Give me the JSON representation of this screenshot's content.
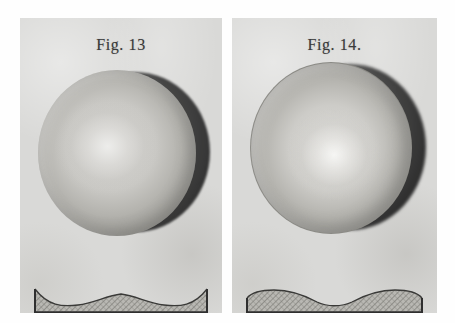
{
  "plate": {
    "background_color": "#ffffff",
    "paper_color": "#d9d9d7",
    "ink_color": "#3a3a3a"
  },
  "figures": [
    {
      "id": "fig-13",
      "label": "Fig. 13",
      "subject": "shaded-sphere-with-offset-crescent-shadow",
      "sphere": {
        "highlight_position": "center-left",
        "shadow_crescent_side": "right",
        "crescent_width": "narrow",
        "outline": "soft"
      },
      "profile": {
        "name": "convex-central-hump-profile",
        "shape": "central raised hump with concave dips at both ends",
        "hatching": "fine diagonal cross-hatch",
        "border_color": "#2f2f2f",
        "fill_color": "#b9b8b3"
      }
    },
    {
      "id": "fig-14",
      "label": "Fig. 14.",
      "subject": "shaded-sphere-with-offset-crescent-shadow",
      "sphere": {
        "highlight_position": "center-lower-right",
        "shadow_crescent_side": "right",
        "crescent_width": "wide",
        "outline": "distinct"
      },
      "profile": {
        "name": "concave-central-dip-profile",
        "shape": "two raised humps with a central concave dip",
        "hatching": "fine diagonal cross-hatch",
        "border_color": "#2f2f2f",
        "fill_color": "#b9b8b3"
      }
    }
  ]
}
